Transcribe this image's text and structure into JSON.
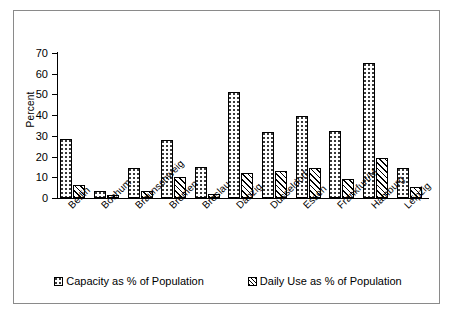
{
  "chart_data": {
    "type": "bar",
    "title": "",
    "xlabel": "",
    "ylabel": "Percent",
    "ylim": [
      0,
      70
    ],
    "yticks": [
      0,
      10,
      20,
      30,
      40,
      50,
      60,
      70
    ],
    "grid": false,
    "legend_position": "bottom",
    "categories": [
      "Berlin",
      "Bochum",
      "Braunschweig",
      "Bremen",
      "Breslau",
      "Danzig",
      "Dusseldorf",
      "Essen",
      "Frankfurt/M",
      "Hamburg",
      "Leipzig"
    ],
    "series": [
      {
        "name": "Capacity as % of Population",
        "pattern": "dotted",
        "values": [
          28.5,
          3.5,
          14.5,
          28,
          15,
          51,
          32,
          39.5,
          32.5,
          65,
          14.5
        ]
      },
      {
        "name": "Daily Use as % of Population",
        "pattern": "diagonal-hatch",
        "values": [
          6.5,
          1.3,
          3.5,
          10,
          2,
          12,
          13,
          14.5,
          9,
          19.5,
          5.5
        ]
      }
    ]
  },
  "axis": {
    "y_title": "Percent"
  },
  "legend": {
    "items": [
      {
        "label": "Capacity as % of Population",
        "pattern": "dotted"
      },
      {
        "label": "Daily Use as % of Population",
        "pattern": "diagonal-hatch"
      }
    ]
  },
  "colors": {
    "frame": "#8a8a8a",
    "axis": "#000000",
    "bar_outline": "#000000",
    "background": "#ffffff"
  }
}
